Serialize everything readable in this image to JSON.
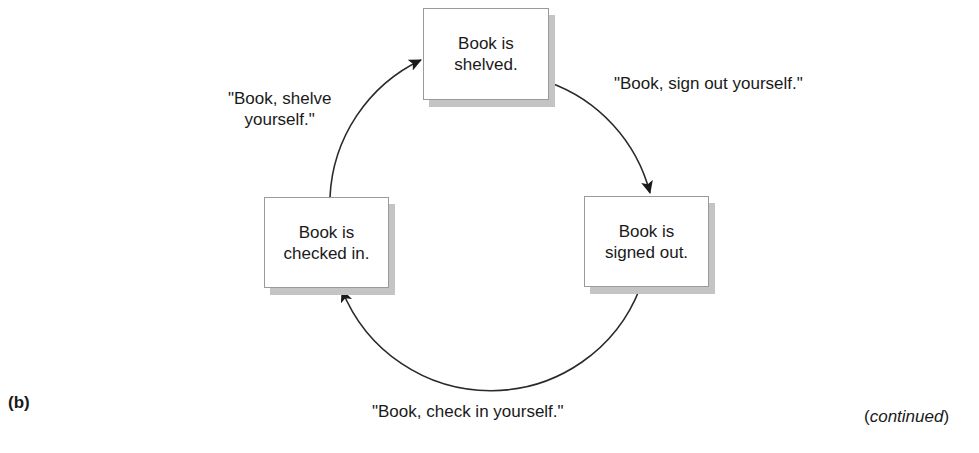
{
  "figure": {
    "panel_label": "(b)",
    "continued": {
      "open": "(",
      "word": "continued",
      "close": ")"
    }
  },
  "states": [
    {
      "id": "shelved",
      "line1": "Book is",
      "line2": "shelved."
    },
    {
      "id": "signed_out",
      "line1": "Book is",
      "line2": "signed out."
    },
    {
      "id": "checked_in",
      "line1": "Book is",
      "line2": "checked in."
    }
  ],
  "transitions": [
    {
      "from": "shelved",
      "to": "signed_out",
      "line1": "\"Book, sign out yourself.\""
    },
    {
      "from": "signed_out",
      "to": "checked_in",
      "line1": "\"Book, check in yourself.\""
    },
    {
      "from": "checked_in",
      "to": "shelved",
      "line1": "\"Book, shelve",
      "line2": "yourself.\""
    }
  ],
  "colors": {
    "line": "#2a2a2a",
    "box_border": "#9a9a9a",
    "shadow": "#c4c4c4",
    "text": "#1a1a1a"
  }
}
